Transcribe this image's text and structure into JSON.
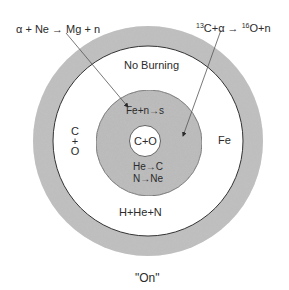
{
  "diagram": {
    "type": "stellar shell burning structure",
    "caption": "\"On\"",
    "colors": {
      "shell_gray": "#b9b9b9",
      "background": "#ffffff",
      "ink": "#2b2b2b"
    },
    "zones": {
      "core": "C+O",
      "inner_shell_top": "Fe+n→s",
      "inner_shell_bottom_1": "He→C",
      "inner_shell_bottom_2": "N→Ne",
      "envelope_top": "No Burning",
      "envelope_left_1": "C",
      "envelope_left_2": "+",
      "envelope_left_3": "O",
      "envelope_right": "Fe",
      "envelope_bottom": "H+He+N"
    },
    "reactions": {
      "left": "α + Ne → Mg + n",
      "right_sup1": "13",
      "right_part1": "C+α → ",
      "right_sup2": "16",
      "right_part2": "O+n"
    }
  }
}
